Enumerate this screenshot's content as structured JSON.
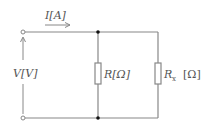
{
  "diagram": {
    "type": "circuit",
    "colors": {
      "wire": "#888888",
      "text": "#555555",
      "junction": "#111111",
      "background": "#ffffff"
    },
    "labels": {
      "current": "I[A]",
      "voltage": "V[V]",
      "resistor_r": "R[Ω]",
      "resistor_rx_main": "R",
      "resistor_rx_sub": "x",
      "resistor_rx_unit": "[Ω]"
    },
    "components": [
      {
        "id": "terminal-top",
        "kind": "open-terminal"
      },
      {
        "id": "terminal-bottom",
        "kind": "open-terminal"
      },
      {
        "id": "resistor-r",
        "kind": "resistor",
        "label": "R[Ω]"
      },
      {
        "id": "resistor-rx",
        "kind": "resistor",
        "label": "Rx [Ω]"
      },
      {
        "id": "junction-top",
        "kind": "junction-dot"
      },
      {
        "id": "junction-bottom",
        "kind": "junction-dot"
      }
    ]
  }
}
